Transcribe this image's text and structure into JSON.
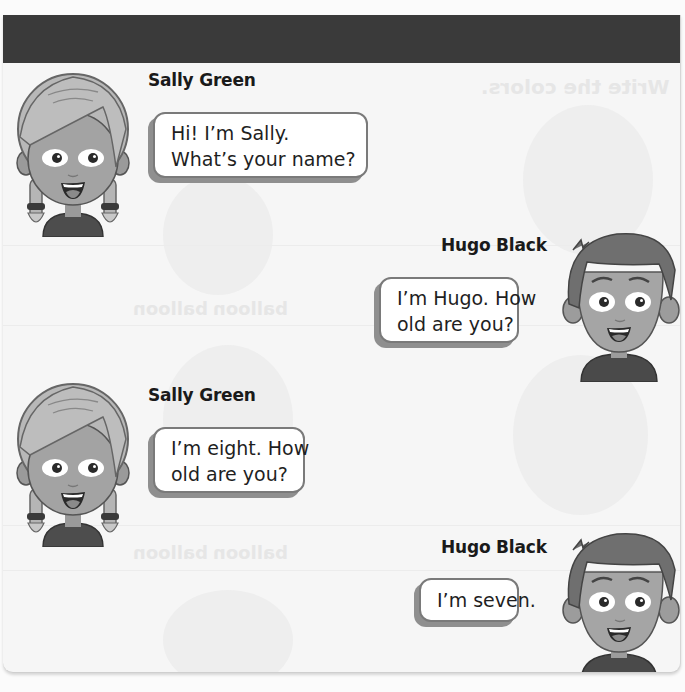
{
  "header": {
    "bar_color": "#3a3a3a"
  },
  "background_bleed": {
    "faint_heading": "Write the colors.",
    "faint_words": [
      "balloon",
      "balloon",
      "balloon",
      "balloon"
    ]
  },
  "dialogue": [
    {
      "speaker": "Sally Green",
      "side": "left",
      "avatar": "girl-avatar",
      "lines": [
        "Hi! I’m Sally.",
        "What’s your name?"
      ]
    },
    {
      "speaker": "Hugo Black",
      "side": "right",
      "avatar": "boy-avatar",
      "lines": [
        "I’m Hugo. How",
        "old are you?"
      ]
    },
    {
      "speaker": "Sally Green",
      "side": "left",
      "avatar": "girl-avatar",
      "lines": [
        "I’m eight. How",
        "old are you?"
      ]
    },
    {
      "speaker": "Hugo Black",
      "side": "right",
      "avatar": "boy-avatar",
      "lines": [
        "I’m seven."
      ]
    }
  ],
  "colors": {
    "page_bg": "#f6f6f6",
    "bubble_bg": "#ffffff",
    "bubble_border": "#7a7a7a",
    "bubble_shadow": "#8f8f8f",
    "text": "#1f1f1f"
  }
}
